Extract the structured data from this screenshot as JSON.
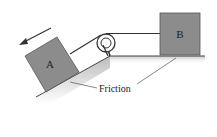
{
  "diagram": {
    "type": "physics-pulley-incline",
    "blocks": [
      {
        "id": "A",
        "label": "A",
        "position": "on incline"
      },
      {
        "id": "B",
        "label": "B",
        "position": "on horizontal surface"
      }
    ],
    "annotations": {
      "friction_label": "Friction"
    },
    "motion_arrow": "down the incline (toward lower left)",
    "colors": {
      "block_fill": "#8c8c8c",
      "block_stroke": "#555555",
      "line": "#333333",
      "ground_shade": "#c8c8c8"
    }
  }
}
